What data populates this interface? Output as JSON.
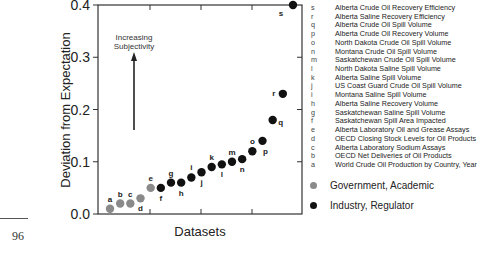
{
  "chart_data": {
    "type": "scatter",
    "title": "",
    "xlabel": "Datasets",
    "ylabel": "Deviation from Expectation",
    "ylim": [
      0.0,
      0.4
    ],
    "y_ticks": [
      "0.0",
      "0.1",
      "0.2",
      "0.3",
      "0.4"
    ],
    "grid": false,
    "annotation": {
      "text_line1": "Increasing",
      "text_line2": "Subjectivity",
      "arrow": "up"
    },
    "legend_position": "right",
    "series": [
      {
        "name": "Government, Academic",
        "color": "#8a8a8a",
        "points": [
          {
            "label": "a",
            "x": 1,
            "y": 0.01
          },
          {
            "label": "b",
            "x": 2,
            "y": 0.02
          },
          {
            "label": "c",
            "x": 3,
            "y": 0.02
          },
          {
            "label": "d",
            "x": 4,
            "y": 0.03
          },
          {
            "label": "e",
            "x": 5,
            "y": 0.05
          }
        ]
      },
      {
        "name": "Industry, Regulator",
        "color": "#111111",
        "points": [
          {
            "label": "f",
            "x": 6,
            "y": 0.05
          },
          {
            "label": "g",
            "x": 7,
            "y": 0.06
          },
          {
            "label": "h",
            "x": 8,
            "y": 0.06
          },
          {
            "label": "i",
            "x": 9,
            "y": 0.07
          },
          {
            "label": "j",
            "x": 10,
            "y": 0.08
          },
          {
            "label": "k",
            "x": 11,
            "y": 0.09
          },
          {
            "label": "l",
            "x": 12,
            "y": 0.095
          },
          {
            "label": "m",
            "x": 13,
            "y": 0.1
          },
          {
            "label": "n",
            "x": 14,
            "y": 0.105
          },
          {
            "label": "o",
            "x": 15,
            "y": 0.12
          },
          {
            "label": "p",
            "x": 16,
            "y": 0.14
          },
          {
            "label": "q",
            "x": 17,
            "y": 0.18
          },
          {
            "label": "r",
            "x": 18,
            "y": 0.23
          },
          {
            "label": "s",
            "x": 19,
            "y": 0.4
          }
        ]
      }
    ],
    "dataset_key": [
      {
        "letter": "s",
        "name": "Alberta Crude Oil Recovery Efficiency"
      },
      {
        "letter": "r",
        "name": "Alberta Saline Recovery Efficiency"
      },
      {
        "letter": "q",
        "name": "Alberta Crude Oil Spill Volume"
      },
      {
        "letter": "p",
        "name": "Alberta Crude Oil Recovery Volume"
      },
      {
        "letter": "o",
        "name": "North Dakota Crude Oil Spill Volume"
      },
      {
        "letter": "n",
        "name": "Montana Crude Oil Spill Volume"
      },
      {
        "letter": "m",
        "name": "Saskatchewan Crude Oil Spill Volume"
      },
      {
        "letter": "l",
        "name": "North Dakota Saline Spill Volume"
      },
      {
        "letter": "k",
        "name": "Alberta Saline Spill Volume"
      },
      {
        "letter": "j",
        "name": "US Coast Guard Crude Oil Spill Volume"
      },
      {
        "letter": "i",
        "name": "Montana Saline Spill Volume"
      },
      {
        "letter": "h",
        "name": "Alberta Saline Recovery Volume"
      },
      {
        "letter": "g",
        "name": "Saskatchewan Saline Spill Volume"
      },
      {
        "letter": "f",
        "name": "Saskatchewan Spill Area Impacted"
      },
      {
        "letter": "e",
        "name": "Alberta Laboratory Oil and Grease Assays"
      },
      {
        "letter": "d",
        "name": "OECD Closing Stock Levels for Oil Products"
      },
      {
        "letter": "c",
        "name": "Alberta Laboratory Sodium Assays"
      },
      {
        "letter": "b",
        "name": "OECD Net Deliveries of Oil Products"
      },
      {
        "letter": "a",
        "name": "World Crude Oil Production by Country, Year"
      }
    ]
  },
  "page": {
    "number": "96"
  }
}
